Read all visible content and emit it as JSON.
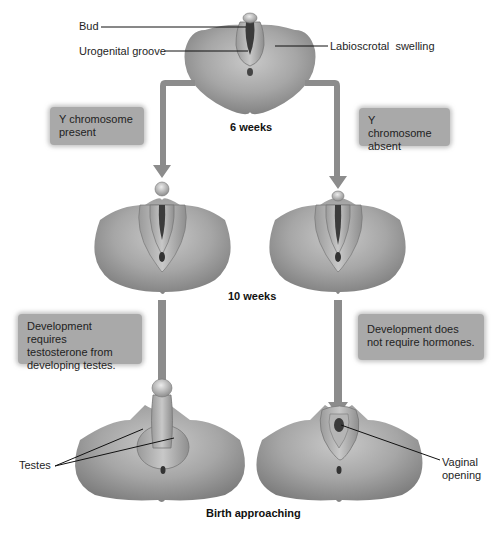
{
  "diagram": {
    "stages": {
      "early": "6 weeks",
      "middle": "10 weeks",
      "late": "Birth approaching"
    },
    "labels": {
      "bud": "Bud",
      "urogenital_groove": "Urogenital groove",
      "labioscrotal_swelling": "Labioscrotal  swelling",
      "testes": "Testes",
      "vaginal_opening_line1": "Vaginal",
      "vaginal_opening_line2": "opening"
    },
    "notes": {
      "y_present": [
        "Y chromosome",
        "present"
      ],
      "y_absent": [
        "Y chromosome",
        "absent"
      ],
      "male_dev": [
        "Development requires",
        "testosterone from",
        "developing testes."
      ],
      "female_dev": [
        "Development does",
        "not require hormones."
      ]
    },
    "colors": {
      "arrow": "#8c8c8c",
      "note_box": "#a9a9a9",
      "tissue_light": "#d2d2d2",
      "tissue_dark": "#7a7a7a"
    }
  }
}
